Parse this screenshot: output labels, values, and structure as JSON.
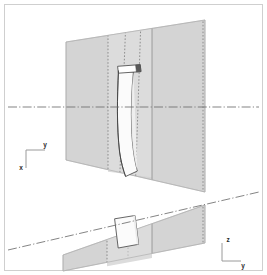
{
  "figure": {
    "canvas": {
      "width": 267,
      "height": 275
    },
    "background_color": "#ffffff",
    "border_color": "#cfcfcf"
  },
  "colors": {
    "panel_fill": "#d4d4d4",
    "panel_fill_light": "#dcdcdc",
    "panel_stroke": "#a8a8a8",
    "blade_fill": "#fbfbfb",
    "blade_fill_shade": "#efefef",
    "blade_stroke": "#4a4a4a",
    "blade_tip_dark": "#5a5a5a",
    "dotted_line": "#7a7a7a",
    "solid_section_line": "#8c8c8c",
    "centerline": "#6e6e6e",
    "axis_stroke": "#9a9a9a",
    "label_color": "#2a2a2a"
  },
  "views": {
    "front": {
      "name": "front-view",
      "panel_shape": "trapezoid",
      "blade_count": 1,
      "section_lines": 5
    },
    "top": {
      "name": "top-view",
      "panel_shape": "tilted-parallelogram",
      "blade_count": 1,
      "section_lines": 4
    }
  },
  "axes": {
    "front_triad": {
      "name": "front-axis-triad",
      "vertical_label": "y",
      "horizontal_label": "x"
    },
    "top_triad": {
      "name": "top-axis-triad",
      "vertical_label": "z",
      "horizontal_label": "y"
    }
  },
  "centerlines": {
    "upper": {
      "name": "upper-centerline",
      "style": "dash-dot",
      "orientation": "horizontal"
    },
    "lower": {
      "name": "lower-centerline",
      "style": "dash-dot",
      "orientation": "inclined"
    }
  }
}
